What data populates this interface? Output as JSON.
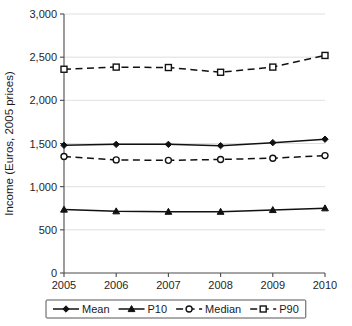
{
  "chart_data": {
    "type": "line",
    "title": "",
    "xlabel": "",
    "ylabel": "Income (Euros, 2005 prices)",
    "categories": [
      "2005",
      "2006",
      "2007",
      "2008",
      "2009",
      "2010"
    ],
    "x": [
      2005,
      2006,
      2007,
      2008,
      2009,
      2010
    ],
    "ylim": [
      0,
      3000
    ],
    "yticks": [
      0,
      500,
      1000,
      1500,
      2000,
      2500,
      3000
    ],
    "ytick_labels": [
      "0",
      "500",
      "1,000",
      "1,500",
      "2,000",
      "2,500",
      "3,000"
    ],
    "xtick_labels": [
      "2005",
      "2006",
      "2007",
      "2008",
      "2009",
      "2010"
    ],
    "grid": true,
    "grid_axis": "y",
    "legend_position": "bottom",
    "series": [
      {
        "name": "Mean",
        "values": [
          1480,
          1490,
          1490,
          1475,
          1510,
          1550
        ],
        "line_style": "solid",
        "marker": "diamond",
        "color": "#111111"
      },
      {
        "name": "P10",
        "values": [
          735,
          715,
          710,
          710,
          730,
          750
        ],
        "line_style": "solid",
        "marker": "triangle",
        "color": "#111111"
      },
      {
        "name": "Median",
        "values": [
          1350,
          1310,
          1305,
          1315,
          1330,
          1360
        ],
        "line_style": "dashed",
        "marker": "circle",
        "color": "#111111"
      },
      {
        "name": "P90",
        "values": [
          2360,
          2385,
          2380,
          2325,
          2385,
          2520
        ],
        "line_style": "dashed",
        "marker": "square-open",
        "color": "#111111"
      }
    ]
  },
  "legend": {
    "items": [
      {
        "label": "Mean",
        "marker": "diamond",
        "line_style": "solid"
      },
      {
        "label": "P10",
        "marker": "triangle",
        "line_style": "solid"
      },
      {
        "label": "Median",
        "marker": "circle",
        "line_style": "dashed"
      },
      {
        "label": "P90",
        "marker": "square-open",
        "line_style": "dashed"
      }
    ]
  },
  "colors": {
    "series": "#111111",
    "grid": "#d7d7d7",
    "axis": "#4a4a4a",
    "background": "#ffffff"
  }
}
